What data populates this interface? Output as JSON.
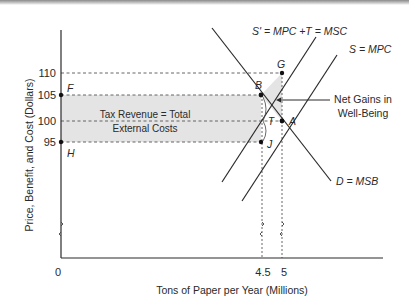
{
  "diagram": {
    "type": "supply-demand with externality tax",
    "y_axis": {
      "label": "Price, Benefit, and Cost (Dollars)",
      "ticks": [
        "110",
        "105",
        "100",
        "95"
      ]
    },
    "x_axis": {
      "label": "Tons of Paper per Year (Millions)",
      "ticks": [
        "0",
        "4.5",
        "5"
      ]
    },
    "curves": {
      "s_prime": "S' = MPC +T = MSC",
      "s": "S = MPC",
      "d": "D = MSB"
    },
    "points": {
      "F": "F",
      "H": "H",
      "B": "B",
      "G": "G",
      "A": "A",
      "J": "J",
      "T": "T"
    },
    "annotations": {
      "tax_revenue_line1": "Tax Revenue = Total",
      "tax_revenue_line2": "External Costs",
      "net_gains_line1": "Net Gains in",
      "net_gains_line2": "Well-Being"
    },
    "colors": {
      "shade": "#e4e4e4",
      "line": "#2a2a2a",
      "dashed": "#555555"
    }
  }
}
